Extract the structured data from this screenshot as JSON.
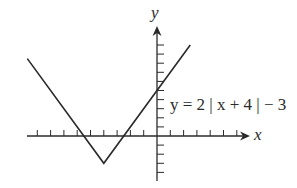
{
  "chart_data": {
    "type": "line",
    "title": "",
    "xlabel": "x",
    "ylabel": "y",
    "annotation": "y = 2 | x + 4 | − 3",
    "function": "y = 2|x + 4| - 3",
    "grid": false,
    "legend": null,
    "x_ticks_unlabeled": [
      -9,
      -8,
      -7,
      -6,
      -5,
      -4,
      -3,
      -2,
      -1,
      1,
      2,
      3,
      4,
      5,
      6
    ],
    "y_ticks_unlabeled": [
      -4,
      -3,
      -2,
      -1,
      1,
      2,
      3,
      4,
      5,
      6,
      7,
      8,
      9,
      10
    ],
    "xlim": [
      -10,
      7.5
    ],
    "ylim": [
      -5,
      11
    ],
    "series": [
      {
        "name": "y = 2|x + 4| - 3",
        "x": [
          -9.75,
          -4,
          2.5
        ],
        "y": [
          8.5,
          -3,
          10
        ]
      }
    ],
    "key_points": {
      "vertex": [
        -4,
        -3
      ],
      "y_intercept": [
        0,
        5
      ],
      "x_intercepts": [
        -5.5,
        -2.5
      ]
    }
  },
  "labels": {
    "equation": "y = 2 | x + 4 | − 3",
    "x_axis": "x",
    "y_axis": "y"
  },
  "colors": {
    "line": "#2a2a2a",
    "axis": "#2a2a2a",
    "background": "#ffffff"
  }
}
